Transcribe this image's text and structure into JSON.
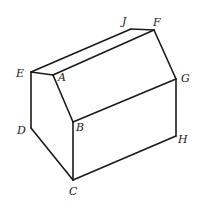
{
  "diagram": {
    "type": "3D prism (house-shaped solid)",
    "vertices": {
      "A": {
        "label": "A"
      },
      "B": {
        "label": "B"
      },
      "C": {
        "label": "C"
      },
      "D": {
        "label": "D"
      },
      "E": {
        "label": "E"
      },
      "F": {
        "label": "F"
      },
      "G": {
        "label": "G"
      },
      "H": {
        "label": "H"
      },
      "J": {
        "label": "J"
      }
    },
    "edges": [
      "E-A",
      "A-B",
      "B-C",
      "C-D",
      "D-E",
      "E-J",
      "J-F",
      "A-F",
      "F-G",
      "B-G",
      "G-H",
      "C-H"
    ],
    "colors": {
      "line": "#1a1a1a",
      "background": "#ffffff"
    }
  }
}
